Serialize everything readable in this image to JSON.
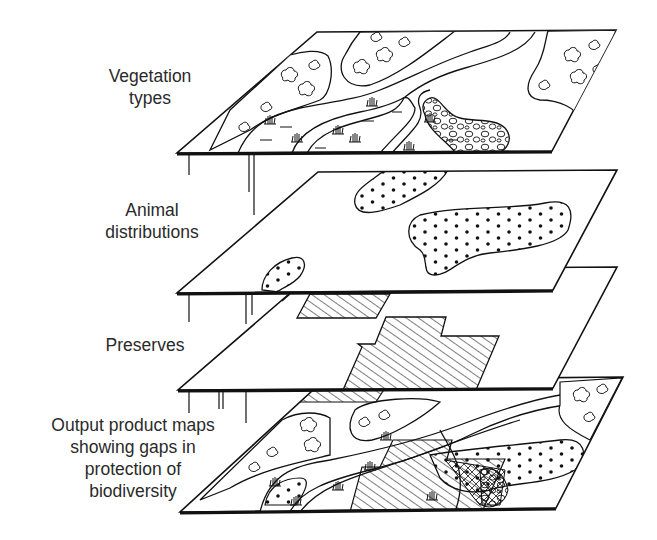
{
  "diagram": {
    "type": "layered-map-overlay",
    "colors": {
      "ink": "#111111",
      "text": "#2a2a2a",
      "background": "#ffffff"
    },
    "layers": [
      {
        "id": "vegetation",
        "label_lines": [
          "Vegetation",
          "types"
        ],
        "pattern": [
          "tree-clumps",
          "rivers",
          "marsh-grass",
          "cobble-pattern"
        ]
      },
      {
        "id": "animals",
        "label_lines": [
          "Animal",
          "distributions"
        ],
        "pattern": [
          "dotted-ranges"
        ]
      },
      {
        "id": "preserves",
        "label_lines": [
          "Preserves"
        ],
        "pattern": [
          "hatched-areas"
        ]
      },
      {
        "id": "output",
        "label_lines": [
          "Output product maps",
          "showing gaps in",
          "protection of",
          "biodiversity"
        ],
        "pattern": [
          "overlay-of-all-layers"
        ]
      }
    ]
  }
}
